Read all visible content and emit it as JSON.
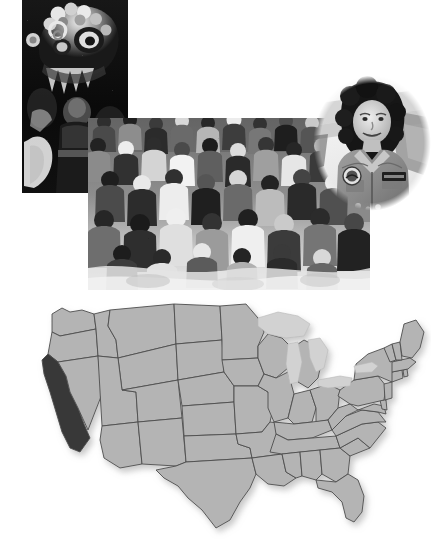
{
  "page": {
    "kind": "photo-collage-with-map",
    "width": 445,
    "height": 545,
    "background_color": "#ffffff"
  },
  "photos": [
    {
      "id": "lion-dance",
      "name": "chinese-lion-dance-photo",
      "caption": "Chinese lion dance performer in an ornate lion head costume at a street parade",
      "subject": "Chinese New Year lion dance",
      "treatment": "black-and-white",
      "shape": "rectangle",
      "edge": "hard",
      "position": {
        "left": 22,
        "top": 0,
        "width": 106,
        "height": 193
      },
      "tone": {
        "background": "#0d0d0d",
        "highlight": "#f2f2f2",
        "midtone": "#6e6e6e"
      }
    },
    {
      "id": "crowd",
      "name": "seated-crowd-photo",
      "caption": "Large crowd of people of many ages seated closely together outdoors at a public gathering",
      "subject": "diverse crowd at community event",
      "treatment": "black-and-white",
      "shape": "rectangle",
      "edge": "feathered",
      "position": {
        "left": 88,
        "top": 118,
        "width": 282,
        "height": 172
      },
      "tone": {
        "background": "#d8d8d8",
        "highlight": "#fafafa",
        "midtone": "#777777"
      }
    },
    {
      "id": "astronaut",
      "name": "astronaut-portrait-photo",
      "caption": "Smiling astronaut in a flight suit with a mission patch and name tag, standing in front of an aircraft",
      "subject": "astronaut portrait",
      "treatment": "black-and-white",
      "shape": "oval",
      "edge": "soft-vignette",
      "position": {
        "left": 312,
        "top": 74,
        "width": 120,
        "height": 138
      },
      "tone": {
        "background": "#f4f4f4",
        "highlight": "#ffffff",
        "midtone": "#8a8a8a"
      }
    }
  ],
  "map": {
    "name": "united-states-map",
    "title": "Contiguous United States",
    "projection_note": "lower 48 states outline",
    "position": {
      "left": 6,
      "top": 296,
      "width": 425,
      "height": 244
    },
    "colors": {
      "state_fill": "#b4b4b4",
      "state_border": "#4d4d4d",
      "highlight_fill": "#383838",
      "lake_fill": "#d2d2d2",
      "background": "#ffffff"
    },
    "highlighted_states": [
      "California"
    ],
    "features": {
      "great_lakes_shown": true,
      "state_borders_shown": true,
      "labels_shown": false,
      "drop_shadow": true
    }
  },
  "chart_data": {
    "type": "map",
    "regions": [
      {
        "name": "California",
        "value": 1,
        "fill": "#383838"
      },
      {
        "name": "Washington",
        "value": 0,
        "fill": "#b4b4b4"
      },
      {
        "name": "Oregon",
        "value": 0,
        "fill": "#b4b4b4"
      },
      {
        "name": "Idaho",
        "value": 0,
        "fill": "#b4b4b4"
      },
      {
        "name": "Nevada",
        "value": 0,
        "fill": "#b4b4b4"
      },
      {
        "name": "Montana",
        "value": 0,
        "fill": "#b4b4b4"
      },
      {
        "name": "Wyoming",
        "value": 0,
        "fill": "#b4b4b4"
      },
      {
        "name": "Utah",
        "value": 0,
        "fill": "#b4b4b4"
      },
      {
        "name": "Arizona",
        "value": 0,
        "fill": "#b4b4b4"
      },
      {
        "name": "Colorado",
        "value": 0,
        "fill": "#b4b4b4"
      },
      {
        "name": "New Mexico",
        "value": 0,
        "fill": "#b4b4b4"
      },
      {
        "name": "North Dakota",
        "value": 0,
        "fill": "#b4b4b4"
      },
      {
        "name": "South Dakota",
        "value": 0,
        "fill": "#b4b4b4"
      },
      {
        "name": "Nebraska",
        "value": 0,
        "fill": "#b4b4b4"
      },
      {
        "name": "Kansas",
        "value": 0,
        "fill": "#b4b4b4"
      },
      {
        "name": "Oklahoma",
        "value": 0,
        "fill": "#b4b4b4"
      },
      {
        "name": "Texas",
        "value": 0,
        "fill": "#b4b4b4"
      },
      {
        "name": "Minnesota",
        "value": 0,
        "fill": "#b4b4b4"
      },
      {
        "name": "Iowa",
        "value": 0,
        "fill": "#b4b4b4"
      },
      {
        "name": "Missouri",
        "value": 0,
        "fill": "#b4b4b4"
      },
      {
        "name": "Arkansas",
        "value": 0,
        "fill": "#b4b4b4"
      },
      {
        "name": "Louisiana",
        "value": 0,
        "fill": "#b4b4b4"
      },
      {
        "name": "Wisconsin",
        "value": 0,
        "fill": "#b4b4b4"
      },
      {
        "name": "Illinois",
        "value": 0,
        "fill": "#b4b4b4"
      },
      {
        "name": "Michigan",
        "value": 0,
        "fill": "#b4b4b4"
      },
      {
        "name": "Indiana",
        "value": 0,
        "fill": "#b4b4b4"
      },
      {
        "name": "Ohio",
        "value": 0,
        "fill": "#b4b4b4"
      },
      {
        "name": "Kentucky",
        "value": 0,
        "fill": "#b4b4b4"
      },
      {
        "name": "Tennessee",
        "value": 0,
        "fill": "#b4b4b4"
      },
      {
        "name": "Mississippi",
        "value": 0,
        "fill": "#b4b4b4"
      },
      {
        "name": "Alabama",
        "value": 0,
        "fill": "#b4b4b4"
      },
      {
        "name": "Georgia",
        "value": 0,
        "fill": "#b4b4b4"
      },
      {
        "name": "Florida",
        "value": 0,
        "fill": "#b4b4b4"
      },
      {
        "name": "South Carolina",
        "value": 0,
        "fill": "#b4b4b4"
      },
      {
        "name": "North Carolina",
        "value": 0,
        "fill": "#b4b4b4"
      },
      {
        "name": "Virginia",
        "value": 0,
        "fill": "#b4b4b4"
      },
      {
        "name": "West Virginia",
        "value": 0,
        "fill": "#b4b4b4"
      },
      {
        "name": "Maryland",
        "value": 0,
        "fill": "#b4b4b4"
      },
      {
        "name": "Delaware",
        "value": 0,
        "fill": "#b4b4b4"
      },
      {
        "name": "Pennsylvania",
        "value": 0,
        "fill": "#b4b4b4"
      },
      {
        "name": "New Jersey",
        "value": 0,
        "fill": "#b4b4b4"
      },
      {
        "name": "New York",
        "value": 0,
        "fill": "#b4b4b4"
      },
      {
        "name": "Connecticut",
        "value": 0,
        "fill": "#b4b4b4"
      },
      {
        "name": "Rhode Island",
        "value": 0,
        "fill": "#b4b4b4"
      },
      {
        "name": "Massachusetts",
        "value": 0,
        "fill": "#b4b4b4"
      },
      {
        "name": "Vermont",
        "value": 0,
        "fill": "#b4b4b4"
      },
      {
        "name": "New Hampshire",
        "value": 0,
        "fill": "#b4b4b4"
      },
      {
        "name": "Maine",
        "value": 0,
        "fill": "#b4b4b4"
      }
    ],
    "legend": [
      {
        "label": "Highlighted state",
        "color": "#383838"
      },
      {
        "label": "Other states",
        "color": "#b4b4b4"
      },
      {
        "label": "Great Lakes",
        "color": "#d2d2d2"
      }
    ],
    "xlabel": "",
    "ylabel": "",
    "grid": false,
    "legend_position": "none"
  }
}
